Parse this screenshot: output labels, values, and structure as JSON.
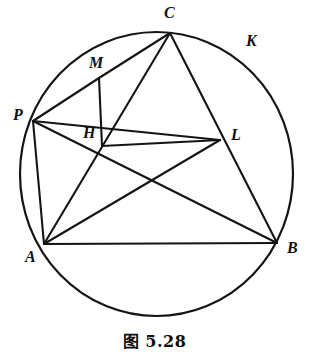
{
  "figure": {
    "caption": "图 5.28",
    "caption_number": "5.28",
    "stroke_color": "#141414",
    "background_color": "#ffffff",
    "width": 309,
    "height": 358
  },
  "circle": {
    "name": "circumcircle",
    "center_x": 156.5,
    "center_y": 174,
    "radius_x": 136.5,
    "radius_y": 142,
    "stroke_width": 2.2
  },
  "points": {
    "A": {
      "label": "A",
      "x": 44,
      "y": 244,
      "label_x": 25,
      "label_y": 249
    },
    "B": {
      "label": "B",
      "x": 277,
      "y": 243,
      "label_x": 287,
      "label_y": 240
    },
    "C": {
      "label": "C",
      "x": 170,
      "y": 33,
      "label_x": 164,
      "label_y": 5
    },
    "P": {
      "label": "P",
      "x": 33,
      "y": 121,
      "label_x": 13,
      "label_y": 107
    },
    "M": {
      "label": "M",
      "x": 99,
      "y": 78,
      "label_x": 89,
      "label_y": 55
    },
    "H": {
      "label": "H",
      "x": 102,
      "y": 146,
      "label_x": 83,
      "label_y": 125
    },
    "L": {
      "label": "L",
      "x": 220,
      "y": 140,
      "label_x": 231,
      "label_y": 127
    },
    "K": {
      "label": "K",
      "x": 253,
      "y": 45,
      "label_x": 246,
      "label_y": 33
    }
  },
  "segments": [
    {
      "name": "segment-AB",
      "from": "A",
      "to": "B"
    },
    {
      "name": "segment-AP",
      "from": "A",
      "to": "P"
    },
    {
      "name": "segment-AC",
      "from": "A",
      "to": "C"
    },
    {
      "name": "segment-PB",
      "from": "P",
      "to": "B"
    },
    {
      "name": "segment-PM",
      "from": "P",
      "to": "M"
    },
    {
      "name": "segment-PL",
      "from": "P",
      "to": "L"
    },
    {
      "name": "segment-MC",
      "from": "M",
      "to": "C"
    },
    {
      "name": "segment-MH",
      "from": "M",
      "to": "H"
    },
    {
      "name": "segment-HL",
      "from": "H",
      "to": "L"
    },
    {
      "name": "segment-CB",
      "from": "C",
      "to": "B"
    },
    {
      "name": "segment-AL",
      "from": "A",
      "to": "L"
    }
  ]
}
